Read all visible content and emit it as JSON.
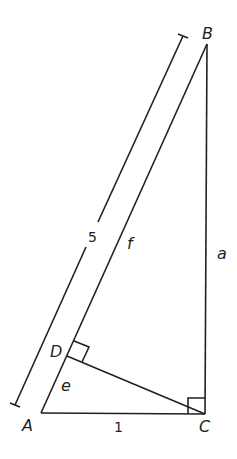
{
  "diagram": {
    "vertices": {
      "A": {
        "label": "A",
        "x": 41,
        "y": 413
      },
      "B": {
        "label": "B",
        "x": 207,
        "y": 44
      },
      "C": {
        "label": "C",
        "x": 205,
        "y": 414
      },
      "D": {
        "label": "D",
        "x": 67,
        "y": 356
      }
    },
    "segment_labels": {
      "AB_dimension": "5",
      "DB": "f",
      "BC": "a",
      "AD": "e",
      "AC": "1"
    },
    "right_angles": [
      "C",
      "D"
    ],
    "colors": {
      "stroke": "#231f20",
      "background": "#ffffff"
    }
  }
}
